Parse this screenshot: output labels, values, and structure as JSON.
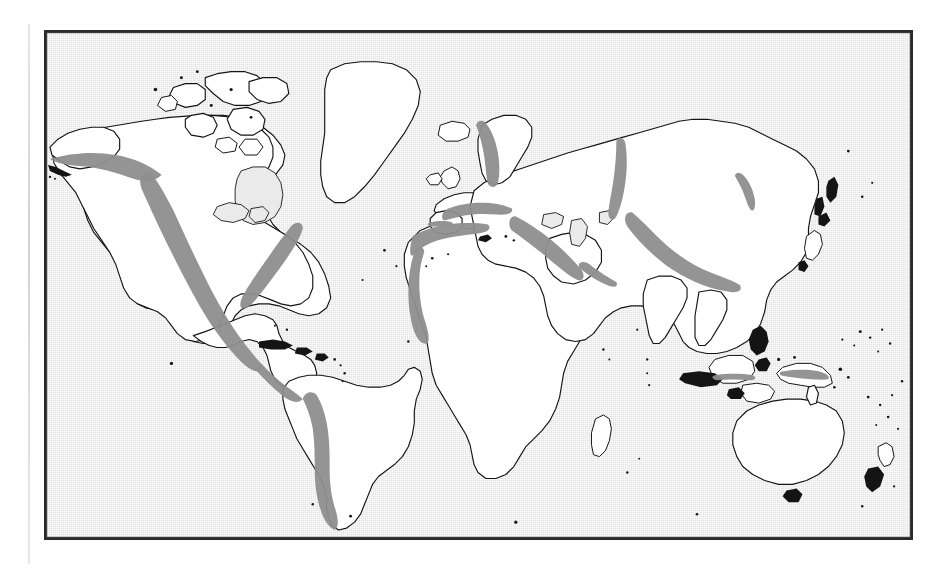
{
  "figure": {
    "kind": "world-map",
    "projection": "cylindrical-equirectangular",
    "frame_border_color": "#2a2a2a",
    "ocean_fill": "#eaeaea",
    "land_fill": "#ffffff",
    "coastline_color": "#141414",
    "highlight_color": "#8e8e8e",
    "page_background": "#ffffff",
    "caption": "",
    "title": "",
    "legend_present": false,
    "labels_present": false,
    "graticule_present": false
  },
  "map_data": {
    "type": "thematic-world-map",
    "theme": "Major mountain belts / orogenic zones shown as gray bands",
    "highlight_regions": [
      {
        "name": "North American Cordillera (Alaska Range / Rockies / Sierra Madre)",
        "continent": "North America",
        "shown": true
      },
      {
        "name": "Appalachian Mountains",
        "continent": "North America",
        "shown": true
      },
      {
        "name": "Andes",
        "continent": "South America",
        "shown": true
      },
      {
        "name": "Atlas Mountains and West African uplands",
        "continent": "Africa",
        "shown": true
      },
      {
        "name": "Alps / Pyrenees / Carpathians",
        "continent": "Europe",
        "shown": true
      },
      {
        "name": "Scandinavian Caledonides",
        "continent": "Europe",
        "shown": true
      },
      {
        "name": "Ural Mountains",
        "continent": "Eurasia",
        "shown": true
      },
      {
        "name": "Anatolian / Caucasus / Zagros belt",
        "continent": "Asia",
        "shown": true
      },
      {
        "name": "Himalaya / Tien Shan / Kunlun belt",
        "continent": "Asia",
        "shown": true
      },
      {
        "name": "Verkhoyansk Range",
        "continent": "Asia",
        "shown": true
      },
      {
        "name": "New Guinea Highlands",
        "continent": "Oceania",
        "shown": true
      }
    ],
    "landmasses": [
      "North America",
      "Greenland",
      "Canadian Arctic Archipelago",
      "Iceland",
      "South America",
      "Africa",
      "Madagascar",
      "Europe",
      "British Isles",
      "Scandinavia",
      "Asia",
      "Arabian Peninsula",
      "India",
      "Japan",
      "Philippines",
      "Indonesia",
      "New Guinea",
      "Australia",
      "New Zealand"
    ],
    "oceans_shaded": true,
    "continents_unshaded": true
  }
}
